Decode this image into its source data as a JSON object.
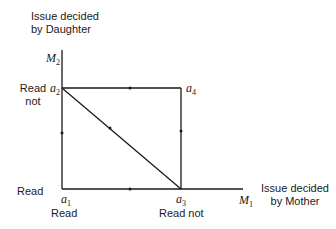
{
  "axes": {
    "y_axis": {
      "name": "M",
      "sub": "2",
      "title_line1": "Issue decided",
      "title_line2": "by Daughter"
    },
    "x_axis": {
      "name": "M",
      "sub": "1",
      "title_line1": "Issue decided",
      "title_line2": "by Mother"
    }
  },
  "points": {
    "a1": {
      "name": "a",
      "sub": "1"
    },
    "a2": {
      "name": "a",
      "sub": "2"
    },
    "a3": {
      "name": "a",
      "sub": "3"
    },
    "a4": {
      "name": "a",
      "sub": "4"
    }
  },
  "labels": {
    "y_top_line1": "Read",
    "y_top_line2": "not",
    "y_bottom": "Read",
    "x_left": "Read",
    "x_right": "Read not"
  },
  "colors": {
    "line": "#1a1a1a",
    "background": "#ffffff"
  }
}
